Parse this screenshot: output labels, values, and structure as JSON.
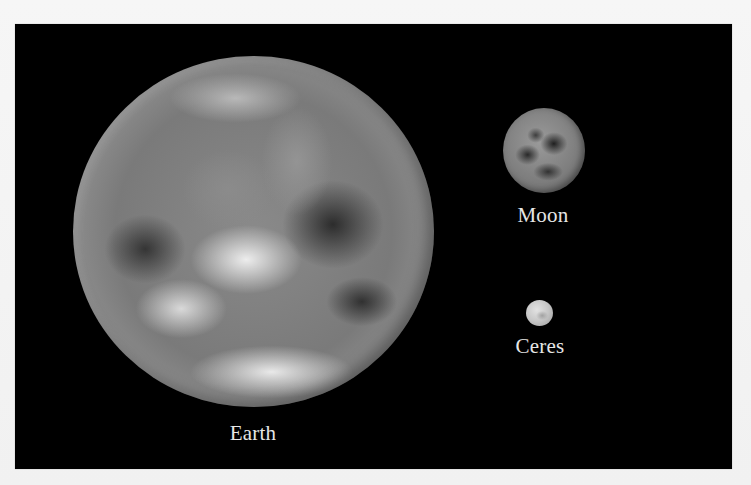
{
  "figure": {
    "background_color": "#000000",
    "page_color": "#f4f4f4",
    "bodies": [
      {
        "name": "Earth",
        "label": "Earth"
      },
      {
        "name": "Moon",
        "label": "Moon"
      },
      {
        "name": "Ceres",
        "label": "Ceres"
      }
    ]
  }
}
